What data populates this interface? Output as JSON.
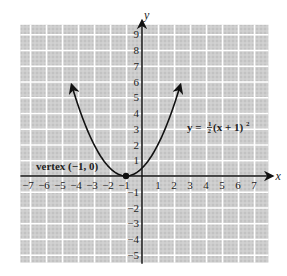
{
  "chart_data": {
    "type": "line",
    "title": "",
    "xlabel": "x",
    "ylabel": "y",
    "xlim": [
      -7.6,
      7.9
    ],
    "ylim": [
      -5.5,
      9.6
    ],
    "grid": true,
    "x_ticks": [
      -7,
      -6,
      -5,
      -4,
      -3,
      -2,
      -1,
      1,
      2,
      3,
      4,
      5,
      6,
      7
    ],
    "x_tick_labels": [
      "−7",
      "−6",
      "−5",
      "−4",
      "−3",
      "−2",
      "−1",
      "1",
      "2",
      "3",
      "4",
      "5",
      "6",
      "7"
    ],
    "y_ticks": [
      -5,
      -4,
      -3,
      -2,
      -1,
      1,
      2,
      3,
      4,
      5,
      6,
      7,
      8,
      9
    ],
    "y_tick_labels": [
      "−5",
      "−4",
      "−3",
      "−2",
      "−1",
      "1",
      "2",
      "3",
      "4",
      "5",
      "6",
      "7",
      "8",
      "9"
    ],
    "series": [
      {
        "name": "y = 1/2(x + 1)^2",
        "function": "0.5*(x+1)^2",
        "x_range": [
          -4.4,
          2.4
        ],
        "arrows_at_ends": true,
        "x": [
          -4.4,
          -4,
          -3,
          -2,
          -1,
          0,
          1,
          2,
          2.4
        ],
        "y": [
          5.78,
          4.5,
          2,
          0.5,
          0,
          0.5,
          2,
          4.5,
          5.78
        ]
      }
    ],
    "annotations": [
      {
        "name": "vertex",
        "text": "vertex (−1, 0)",
        "point": [
          -1,
          0
        ]
      },
      {
        "name": "equation",
        "text_prefix": "y = ",
        "fraction_num": "1",
        "fraction_den": "2",
        "text_suffix": "(x + 1)",
        "exponent": "2"
      }
    ],
    "colors": {
      "background": "#cbcbcb",
      "grid_line": "#ffffff",
      "axis": "#111111",
      "curve": "#111111"
    }
  }
}
